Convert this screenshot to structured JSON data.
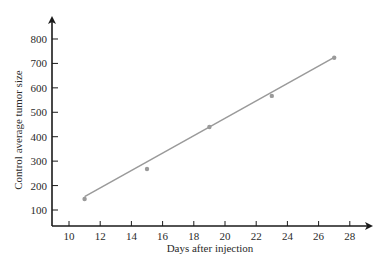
{
  "chart_data": {
    "type": "scatter",
    "title": "",
    "xlabel": "Days after injection",
    "ylabel": "Control average tumor size",
    "xlim": [
      9,
      29
    ],
    "ylim": [
      30,
      880
    ],
    "xticks": [
      10,
      12,
      14,
      16,
      18,
      20,
      22,
      24,
      26,
      28
    ],
    "yticks": [
      100,
      200,
      300,
      400,
      500,
      600,
      700,
      800
    ],
    "grid": false,
    "legend": null,
    "series": [
      {
        "name": "Observed",
        "type": "scatter",
        "color": "#9a9a9a",
        "x": [
          11,
          15,
          19,
          23,
          27
        ],
        "y": [
          145,
          268,
          440,
          567,
          723
        ]
      },
      {
        "name": "Regression line",
        "type": "line",
        "color": "#9a9a9a",
        "x": [
          11,
          27
        ],
        "y": [
          155,
          725
        ]
      }
    ]
  },
  "colors": {
    "axis": "#1a1a1a",
    "line": "#9a9a9a",
    "points": "#9a9a9a",
    "text": "#2a2a2a"
  }
}
